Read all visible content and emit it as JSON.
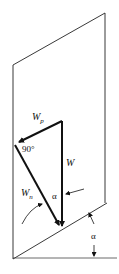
{
  "diagram": {
    "type": "force-vector-diagram",
    "labels": {
      "weight": "W",
      "weight_parallel_main": "W",
      "weight_parallel_sub": "p",
      "weight_normal_main": "W",
      "weight_normal_sub": "n",
      "right_angle": "90°",
      "angle_inside": "α",
      "angle_incline": "α"
    },
    "colors": {
      "line": "#111111",
      "background": "#ffffff"
    }
  }
}
